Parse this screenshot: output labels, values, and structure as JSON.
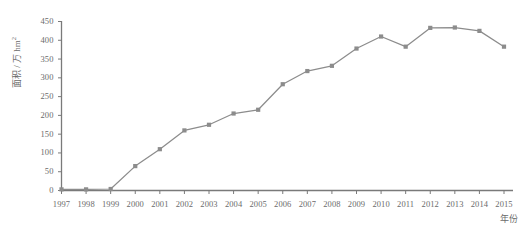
{
  "chart_data": {
    "type": "line",
    "title": "",
    "xlabel": "年份",
    "ylabel_main": "面积 / 万 hm",
    "ylabel_exponent": "2",
    "categories": [
      "1997",
      "1998",
      "1999",
      "2000",
      "2001",
      "2002",
      "2003",
      "2004",
      "2005",
      "2006",
      "2007",
      "2008",
      "2009",
      "2010",
      "2011",
      "2012",
      "2013",
      "2014",
      "2015"
    ],
    "values": [
      3,
      3,
      4,
      65,
      110,
      160,
      175,
      205,
      215,
      283,
      318,
      332,
      378,
      410,
      383,
      433,
      434,
      425,
      383
    ],
    "ylim": [
      0,
      450
    ],
    "yticks": [
      0,
      50,
      100,
      150,
      200,
      250,
      300,
      350,
      400,
      450
    ],
    "grid": false,
    "legend": "none",
    "marker": "square",
    "series_color": "#8c8c8c",
    "axis_color": "#7a7a7a",
    "text_color": "#6b6b6b"
  }
}
